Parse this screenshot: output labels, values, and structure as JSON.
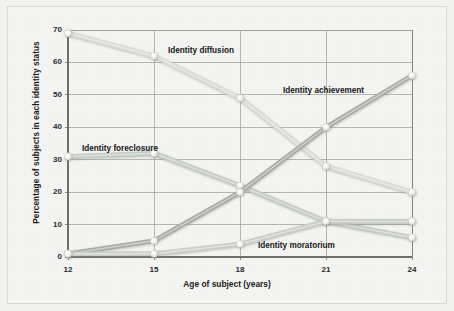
{
  "chart_data": {
    "type": "line",
    "title": "",
    "xlabel": "Age of subject (years)",
    "ylabel": "Percentage of subjects in each identity status",
    "x": [
      12,
      15,
      18,
      21,
      24
    ],
    "categories": [
      "12",
      "15",
      "18",
      "21",
      "24"
    ],
    "xlim": [
      12,
      24
    ],
    "ylim": [
      0,
      70
    ],
    "yticks": [
      0,
      10,
      20,
      30,
      40,
      50,
      60,
      70
    ],
    "ytick_labels": [
      "0",
      "10",
      "20",
      "30",
      "40",
      "50",
      "60",
      "70"
    ],
    "grid": true,
    "legend_position": "inline-annotations",
    "series": [
      {
        "name": "Identity diffusion",
        "values": [
          69,
          62,
          49,
          28,
          20
        ],
        "color": "#d9dbd6",
        "label_x": 168,
        "label_y": 46
      },
      {
        "name": "Identity foreclosure",
        "values": [
          31,
          32,
          22,
          11,
          6
        ],
        "color": "#c4cbc2",
        "label_x": 82,
        "label_y": 144
      },
      {
        "name": "Identity achievement",
        "values": [
          1,
          5,
          20,
          40,
          56
        ],
        "color": "#a7aba4",
        "label_x": 283,
        "label_y": 86
      },
      {
        "name": "Identity moratorium",
        "values": [
          1,
          1,
          4,
          11,
          11
        ],
        "color": "#c9cec6",
        "label_x": 258,
        "label_y": 241
      }
    ],
    "annotations": [
      "Identity diffusion",
      "Identity foreclosure",
      "Identity achievement",
      "Identity moratorium"
    ]
  },
  "style": {
    "background": "#f2f2f0",
    "panel": "#f4f4f2",
    "grid_color": "#9a9a96",
    "axis_color": "#6e6e6a",
    "text_color": "#1b1b1b",
    "marker_fill": "#f0f0ee"
  }
}
